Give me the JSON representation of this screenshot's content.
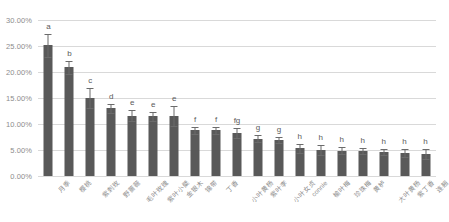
{
  "chart_data": {
    "type": "bar",
    "title": "",
    "subtitle": "",
    "xlabel": "",
    "ylabel": "",
    "ylim": [
      0,
      30
    ],
    "ytick_labels": [
      "0.00%",
      "5.00%",
      "10.00%",
      "15.00%",
      "20.00%",
      "25.00%",
      "30.00%"
    ],
    "ytick_values": [
      0,
      5,
      10,
      15,
      20,
      25,
      30
    ],
    "grid": true,
    "legend": "none",
    "error_bar_type": "standard-error",
    "bar_color": "#595959",
    "gridline_color": "#d9d9d9",
    "axis_text_color": "#8c8c8c",
    "categories": [
      "月季",
      "樱桃",
      "紫刺玫",
      "野蔷薇",
      "毛叶玫瑰",
      "紫叶小檗",
      "金银木",
      "锦带",
      "丁香",
      "小叶黄杨",
      "紫叶李",
      "小叶女贞",
      "connie",
      "榆叶梅",
      "珍珠梅",
      "黄栌",
      "大叶黄杨",
      "紫丁香",
      "连翘"
    ],
    "values": [
      25.1,
      20.9,
      15.0,
      13.0,
      11.6,
      11.5,
      11.5,
      8.8,
      8.8,
      8.3,
      7.2,
      6.9,
      5.3,
      5.0,
      4.9,
      4.8,
      4.6,
      4.4,
      4.2
    ],
    "errors": [
      2.3,
      1.2,
      2.0,
      0.8,
      1.0,
      0.9,
      1.9,
      0.7,
      0.7,
      0.9,
      0.7,
      0.6,
      0.8,
      0.9,
      0.6,
      0.5,
      0.6,
      0.8,
      0.9
    ],
    "significance_letters": [
      "a",
      "b",
      "c",
      "d",
      "e",
      "e",
      "e",
      "f",
      "f",
      "fg",
      "g",
      "g",
      "h",
      "h",
      "h",
      "h",
      "h",
      "h",
      "h"
    ]
  }
}
